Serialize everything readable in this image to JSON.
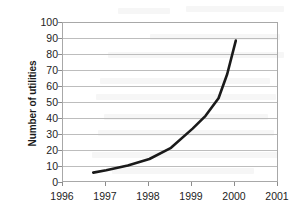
{
  "chart_data": {
    "type": "line",
    "title": "",
    "xlabel": "",
    "ylabel": "Number of utilities",
    "xlim": [
      1996,
      2001
    ],
    "ylim": [
      0,
      100
    ],
    "x_ticks": [
      "1996",
      "1997",
      "1998",
      "1999",
      "2000",
      "2001"
    ],
    "y_ticks": [
      "0",
      "10",
      "20",
      "30",
      "40",
      "50",
      "60",
      "70",
      "80",
      "90",
      "100"
    ],
    "grid": "horizontal",
    "legend": "none",
    "series": [
      {
        "name": "Number of utilities",
        "color": "#1a1a1a",
        "x": [
          1996.7,
          1997.0,
          1997.5,
          1998.0,
          1998.5,
          1999.0,
          1999.3,
          1999.6,
          1999.8,
          2000.0
        ],
        "values": [
          6.5,
          8,
          11,
          15,
          22,
          34,
          42,
          53,
          68,
          89
        ]
      }
    ]
  },
  "axes": {
    "y_title": "Number of utilities",
    "y_tick_labels": [
      "100",
      "90",
      "80",
      "70",
      "60",
      "50",
      "40",
      "30",
      "20",
      "10",
      "0"
    ],
    "x_tick_labels": [
      "1996",
      "1997",
      "1998",
      "1999",
      "2000",
      "2001"
    ]
  },
  "colors": {
    "line": "#1a1a1a",
    "gridline": "#bdbdbd",
    "frame": "#a8a8a8",
    "text": "#232323",
    "background": "#ffffff"
  }
}
